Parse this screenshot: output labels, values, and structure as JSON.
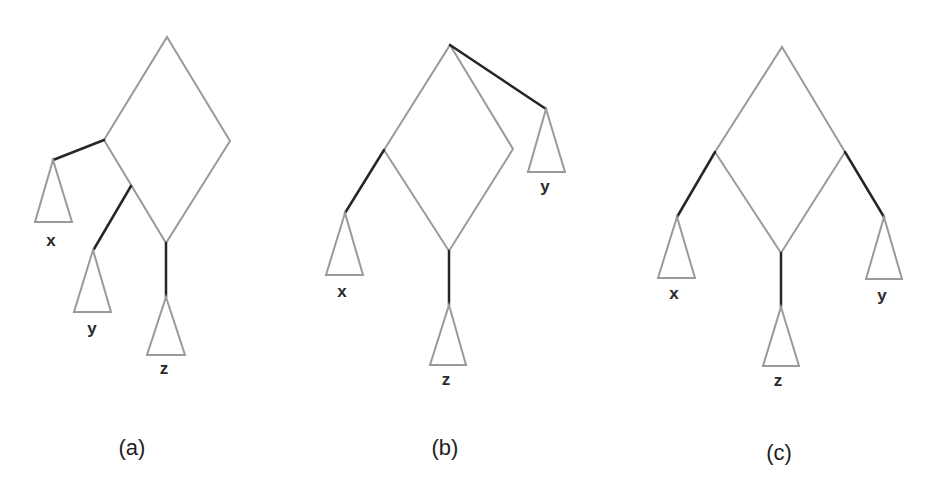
{
  "figure": {
    "colors": {
      "gray_edge": "#9a9a9a",
      "black_edge": "#262626",
      "text": "#2a2a2a"
    },
    "panels": [
      {
        "id": "a",
        "caption": "(a)",
        "subtrees": [
          {
            "label": "x"
          },
          {
            "label": "y"
          },
          {
            "label": "z"
          }
        ]
      },
      {
        "id": "b",
        "caption": "(b)",
        "subtrees": [
          {
            "label": "x"
          },
          {
            "label": "y"
          },
          {
            "label": "z"
          }
        ]
      },
      {
        "id": "c",
        "caption": "(c)",
        "subtrees": [
          {
            "label": "x"
          },
          {
            "label": "y"
          },
          {
            "label": "z"
          }
        ]
      }
    ]
  }
}
